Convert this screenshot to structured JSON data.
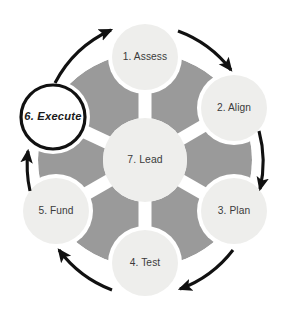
{
  "diagram": {
    "type": "cycle-hub-and-spoke",
    "title": "",
    "background_color": "#ffffff",
    "disc_color": "#9a9a9a",
    "node_fill": "#eeeeec",
    "highlight_fill": "#ffffff",
    "highlight_stroke": "#111111",
    "arrow_color": "#111111",
    "label_color": "#3b3b3b",
    "geometry": {
      "center_x": 145,
      "center_y": 160,
      "disc_radius": 107,
      "hub_radius": 42,
      "node_radius": 33,
      "node_orbit_radius": 103
    },
    "hub": {
      "id": "lead",
      "label": "7. Lead",
      "number": "7",
      "name": "Lead",
      "cx": 145,
      "cy": 160
    },
    "nodes": [
      {
        "id": "assess",
        "label": "1. Assess",
        "number": "1",
        "name": "Assess",
        "angle_deg": -90,
        "cx": 145,
        "cy": 57,
        "highlight": false
      },
      {
        "id": "align",
        "label": "2. Align",
        "number": "2",
        "name": "Align",
        "angle_deg": -30,
        "cx": 234,
        "cy": 108,
        "highlight": false
      },
      {
        "id": "plan",
        "label": "3. Plan",
        "number": "3",
        "name": "Plan",
        "angle_deg": 30,
        "cx": 234,
        "cy": 211,
        "highlight": false
      },
      {
        "id": "test",
        "label": "4. Test",
        "number": "4",
        "name": "Test",
        "angle_deg": 90,
        "cx": 145,
        "cy": 263,
        "highlight": false
      },
      {
        "id": "fund",
        "label": "5. Fund",
        "number": "5",
        "name": "Fund",
        "angle_deg": 150,
        "cx": 56,
        "cy": 211,
        "highlight": false
      },
      {
        "id": "execute",
        "label": "6. Execute",
        "number": "6",
        "name": "Execute",
        "angle_deg": -150,
        "cx": 53,
        "cy": 117,
        "highlight": true
      }
    ],
    "flow": {
      "direction": "clockwise",
      "sequence": [
        "1. Assess",
        "2. Align",
        "3. Plan",
        "4. Test",
        "5. Fund",
        "6. Execute"
      ],
      "arrows": [
        {
          "id": "arrow-assess-to-align",
          "from": "assess",
          "to": "align"
        },
        {
          "id": "arrow-align-to-plan",
          "from": "align",
          "to": "plan"
        },
        {
          "id": "arrow-plan-to-test",
          "from": "plan",
          "to": "test"
        },
        {
          "id": "arrow-test-to-fund",
          "from": "test",
          "to": "fund"
        },
        {
          "id": "arrow-fund-to-execute",
          "from": "fund",
          "to": "execute"
        },
        {
          "id": "arrow-execute-to-assess",
          "from": "execute",
          "to": "assess"
        }
      ]
    }
  }
}
